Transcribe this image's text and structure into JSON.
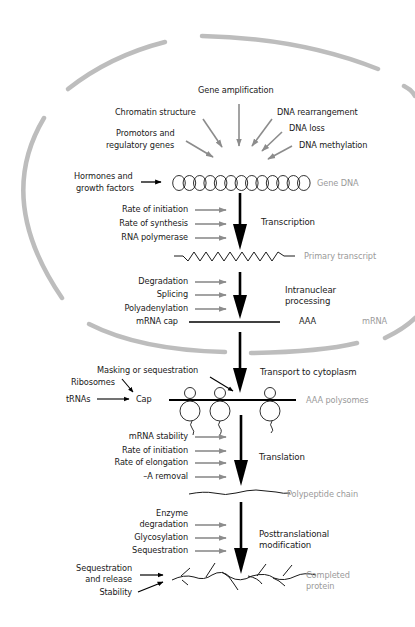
{
  "figure": {
    "nucleus_label": "",
    "colors": {
      "membrane": "#bdbdbd",
      "black_arrow": "#000000",
      "gray_arrow": "#8c8c8c",
      "stage_label": "#9a9a9a",
      "text": "#1a1a1a"
    }
  },
  "gene_level": {
    "inputs": [
      "Gene amplification",
      "Chromatin structure",
      "DNA rearrangement",
      "Promotors and",
      "regulatory genes",
      "DNA loss",
      "DNA methylation"
    ],
    "hormones": [
      "Hormones and",
      "growth factors"
    ]
  },
  "stages": {
    "gene_dna": "Gene DNA",
    "primary_transcript": "Primary transcript",
    "mrna": "mRNA",
    "polysomes": "AAA polysomes",
    "polypeptide": "Polypeptide chain",
    "completed_protein": [
      "Completed",
      "protein"
    ]
  },
  "processes": {
    "transcription": "Transcription",
    "intranuclear": [
      "Intranuclear",
      "processing"
    ],
    "transport": "Transport to cytoplasm",
    "translation": "Translation",
    "posttranslational": [
      "Posttranslational",
      "modification"
    ]
  },
  "regulators": {
    "transcription": [
      "Rate of initiation",
      "Rate of synthesis",
      "RNA polymerase"
    ],
    "intranuclear": [
      "Degradation",
      "Splicing",
      "Polyadenylation"
    ],
    "mrna_labels": {
      "cap": "mRNA cap",
      "tail": "AAA"
    },
    "transport": {
      "masking": "Masking or sequestration",
      "ribosomes": "Ribosomes",
      "trnas": "tRNAs",
      "cap": "Cap"
    },
    "translation": [
      "mRNA stability",
      "Rate of initiation",
      "Rate of elongation",
      "–A removal"
    ],
    "posttranslational": [
      "Enzyme",
      "degradation",
      "Glycosylation",
      "Sequestration"
    ],
    "protein": [
      "Sequestration",
      "and release",
      "Stability"
    ]
  }
}
